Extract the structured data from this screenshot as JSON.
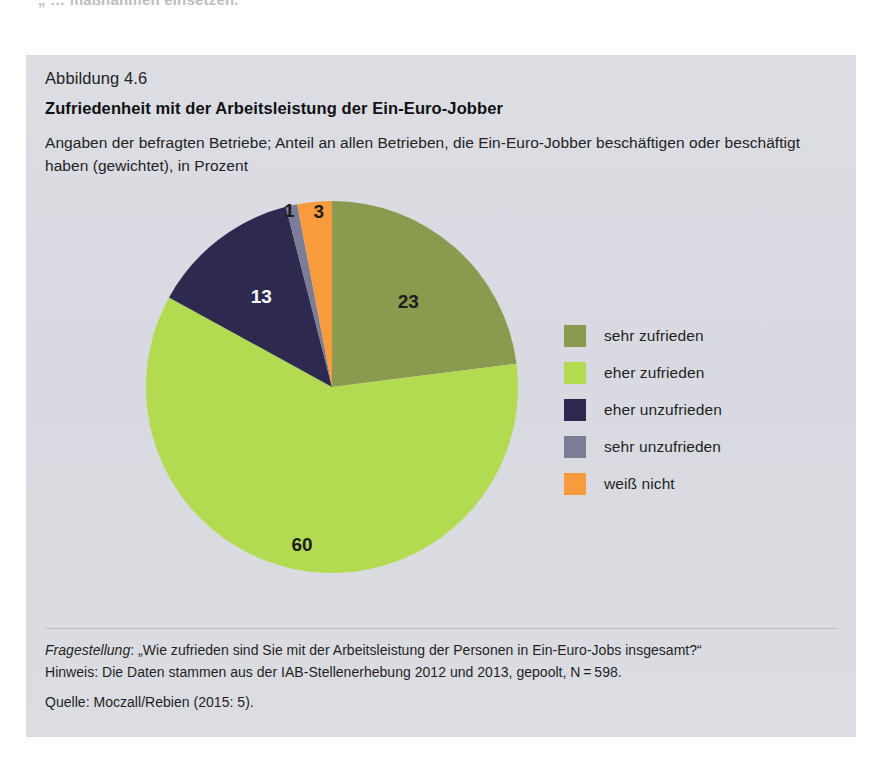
{
  "page": {
    "top_running_text": "„  … maßnahmen einsetzen."
  },
  "figure": {
    "number": "Abbildung 4.6",
    "title": "Zufriedenheit mit der Arbeitsleistung der Ein-Euro-Jobber",
    "subtitle": "Angaben der befragten Betriebe; Anteil an allen Betrieben, die Ein-Euro-Jobber beschäftigen oder beschäftigt haben (gewichtet), in Prozent"
  },
  "legend": {
    "items": [
      {
        "label": "sehr zufrieden",
        "color": "#8a9a4e"
      },
      {
        "label": "eher zufrieden",
        "color": "#b3db52"
      },
      {
        "label": "eher unzufrieden",
        "color": "#2e2a4f"
      },
      {
        "label": "sehr unzufrieden",
        "color": "#7b7c95"
      },
      {
        "label": "weiß nicht",
        "color": "#f79b3c"
      }
    ]
  },
  "footer": {
    "question_label": "Fragestellung",
    "question_text": ": „Wie zufrieden sind Sie mit der Arbeitsleistung der Personen in Ein-Euro-Jobs insgesamt?“",
    "note": "Hinweis: Die Daten stammen aus der IAB-Stellenerhebung 2012 und 2013, gepoolt, N = 598.",
    "source": "Quelle: Moczall/Rebien (2015: 5)."
  },
  "chart_data": {
    "type": "pie",
    "title": "Zufriedenheit mit der Arbeitsleistung der Ein-Euro-Jobber",
    "subtitle": "Angaben der befragten Betriebe; Anteil an allen Betrieben, die Ein-Euro-Jobber beschäftigen oder beschäftigt haben (gewichtet), in Prozent",
    "unit": "Prozent",
    "legend_position": "right",
    "start_angle_deg": 0,
    "direction": "clockwise",
    "categories": [
      "sehr zufrieden",
      "eher zufrieden",
      "eher unzufrieden",
      "sehr unzufrieden",
      "weiß nicht"
    ],
    "values": [
      23,
      60,
      13,
      1,
      3
    ],
    "labels": [
      "23",
      "60",
      "13",
      "1",
      "3"
    ],
    "colors": [
      "#8a9a4e",
      "#b3db52",
      "#2e2a4f",
      "#7b7c95",
      "#f79b3c"
    ],
    "label_colors": [
      "dark",
      "dark",
      "light",
      "dark",
      "dark"
    ]
  }
}
